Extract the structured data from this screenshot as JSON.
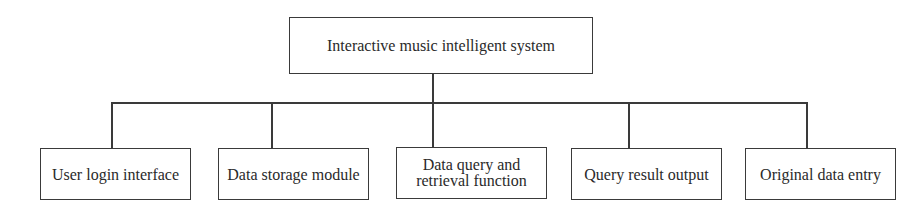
{
  "diagram": {
    "type": "hierarchy",
    "root": {
      "label": "Interactive music intelligent system"
    },
    "children": [
      {
        "label": "User login interface"
      },
      {
        "label": "Data storage module"
      },
      {
        "label": "Data query and retrieval function"
      },
      {
        "label": "Query result output"
      },
      {
        "label": "Original data entry"
      }
    ],
    "colors": {
      "line": "#3a3a3a",
      "text": "#2a2a2a",
      "background": "#ffffff"
    }
  }
}
